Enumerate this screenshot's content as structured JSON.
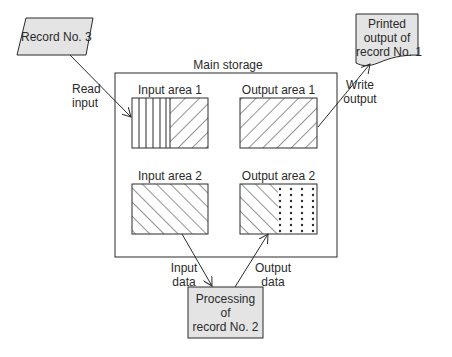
{
  "input_record": {
    "label": "Record No. 3"
  },
  "read_input": {
    "line1": "Read",
    "line2": "input"
  },
  "main_storage": {
    "title": "Main storage"
  },
  "areas": {
    "input_area_1": {
      "label": "Input area 1"
    },
    "output_area_1": {
      "label": "Output area 1"
    },
    "input_area_2": {
      "label": "Input area 2"
    },
    "output_area_2": {
      "label": "Output area 2"
    }
  },
  "write_output": {
    "line1": "Write",
    "line2": "output"
  },
  "printed_output": {
    "line1": "Printed",
    "line2": "output of",
    "line3": "record No. 1"
  },
  "input_data": {
    "line1": "Input",
    "line2": "data"
  },
  "output_data": {
    "line1": "Output",
    "line2": "data"
  },
  "processing": {
    "line1": "Processing",
    "line2": "of",
    "line3": "record No. 2"
  },
  "colors": {
    "shape_fill": "#e4e4e4",
    "stroke": "#2a2a2a",
    "background": "#ffffff"
  }
}
